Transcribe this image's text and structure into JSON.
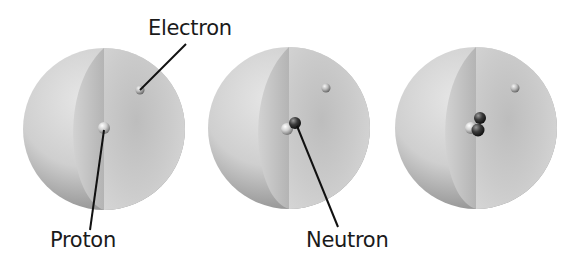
{
  "diagram": {
    "atoms": [
      {
        "name": "atom-1",
        "particles": [
          "proton"
        ],
        "electron": true
      },
      {
        "name": "atom-2",
        "particles": [
          "proton",
          "neutron"
        ],
        "electron": true
      },
      {
        "name": "atom-3",
        "particles": [
          "proton",
          "neutron",
          "neutron"
        ],
        "electron": true
      }
    ],
    "labels": {
      "electron": "Electron",
      "proton": "Proton",
      "neutron": "Neutron"
    },
    "colors": {
      "sphere_light": "#dcdcdc",
      "sphere_dark": "#8f8f8f",
      "cutaway": "#c8c8c8",
      "proton": "#d8d8d8",
      "neutron": "#3a3a3a",
      "leader_line": "#111111"
    }
  }
}
